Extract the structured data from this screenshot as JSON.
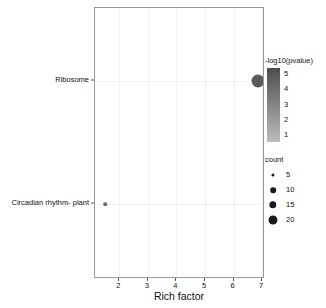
{
  "chart_data": {
    "type": "scatter",
    "title": "",
    "subtitle": "",
    "xlabel": "Rich factor",
    "ylabel": "",
    "xlim": [
      1.15,
      7.1
    ],
    "ylim": [
      0,
      1
    ],
    "grid": true,
    "xticks": [
      2,
      3,
      4,
      5,
      6,
      7
    ],
    "xtick_labels": [
      "2",
      "3",
      "4",
      "5",
      "6",
      "7"
    ],
    "categories": [
      "Ribosome",
      "Circadian rhythm- plant"
    ],
    "points": [
      {
        "label": "Ribosome",
        "x": 6.85,
        "y": 0.73,
        "count": 20,
        "neglog10_pvalue": 4.6,
        "radius_px": 6.5,
        "color": "#5a5a5a"
      },
      {
        "label": "Circadian rhythm- plant",
        "x": 1.5,
        "y": 0.275,
        "count": 2,
        "neglog10_pvalue": 1.2,
        "radius_px": 1.8,
        "color": "#6b6b6b"
      }
    ],
    "color_legend": {
      "title": "-log10(pvalue)",
      "ticks": [
        5,
        4,
        3,
        2,
        1
      ],
      "tick_labels": [
        "5",
        "4",
        "3",
        "2",
        "1"
      ],
      "gradient_top": "#4d4d4d",
      "gradient_bottom": "#bdbdbd",
      "position": "right-top"
    },
    "size_legend": {
      "title": "count",
      "values": [
        5,
        10,
        15,
        20
      ],
      "value_labels": [
        "5",
        "10",
        "15",
        "20"
      ],
      "dot_sizes_px": [
        3.2,
        5.6,
        7.4,
        9.0
      ],
      "position": "right-bottom"
    }
  },
  "panel": {
    "background": "#ffffff",
    "border_color": "#9a9a9a",
    "gridline_color": "#f0f0f0"
  },
  "axis": {
    "x_title": "Rich factor",
    "tick_color": "#555555",
    "label_color": "#111111"
  }
}
